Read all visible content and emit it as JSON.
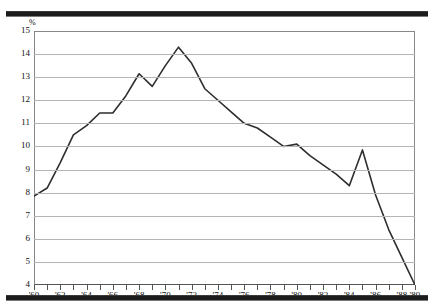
{
  "figure": {
    "unit_label": "%",
    "rules": [
      "top-rule",
      "bottom-rule"
    ]
  },
  "chart_data": {
    "type": "line",
    "title": "",
    "subtitle": "",
    "xlabel": "",
    "ylabel": "%",
    "xlim": [
      1960,
      1989
    ],
    "ylim": [
      4,
      15
    ],
    "grid": true,
    "legend": null,
    "y_ticks": [
      15,
      14,
      13,
      12,
      11,
      10,
      9,
      8,
      7,
      6,
      5,
      4
    ],
    "y_tick_labels": [
      "15",
      "14",
      "13",
      "12",
      "11",
      "10",
      "9",
      "8",
      "7",
      "6",
      "5",
      "4"
    ],
    "x_ticks": [
      1960,
      1961,
      1962,
      1963,
      1964,
      1965,
      1966,
      1967,
      1968,
      1969,
      1970,
      1971,
      1972,
      1973,
      1974,
      1975,
      1976,
      1977,
      1978,
      1979,
      1980,
      1981,
      1982,
      1983,
      1984,
      1985,
      1986,
      1987,
      1988,
      1989
    ],
    "x_tick_labels": [
      {
        "x": 1960,
        "label": "'60"
      },
      {
        "x": 1962,
        "label": "'62"
      },
      {
        "x": 1964,
        "label": "'64"
      },
      {
        "x": 1966,
        "label": "'66"
      },
      {
        "x": 1968,
        "label": "'68"
      },
      {
        "x": 1970,
        "label": "'70"
      },
      {
        "x": 1972,
        "label": "'72"
      },
      {
        "x": 1974,
        "label": "'74"
      },
      {
        "x": 1976,
        "label": "'76"
      },
      {
        "x": 1978,
        "label": "'78"
      },
      {
        "x": 1980,
        "label": "'80"
      },
      {
        "x": 1982,
        "label": "'82"
      },
      {
        "x": 1984,
        "label": "'84"
      },
      {
        "x": 1986,
        "label": "'86"
      },
      {
        "x": 1988,
        "label": "'88"
      },
      {
        "x": 1989,
        "label": "'89"
      }
    ],
    "x": [
      1960,
      1961,
      1962,
      1963,
      1964,
      1965,
      1966,
      1967,
      1968,
      1969,
      1970,
      1971,
      1972,
      1973,
      1974,
      1975,
      1976,
      1977,
      1978,
      1979,
      1980,
      1981,
      1982,
      1983,
      1984,
      1985,
      1986,
      1987,
      1988,
      1989
    ],
    "values": [
      7.85,
      8.2,
      9.3,
      10.5,
      10.9,
      11.45,
      11.45,
      12.2,
      13.15,
      12.6,
      13.5,
      14.3,
      13.6,
      12.5,
      12.0,
      11.5,
      11.0,
      10.8,
      10.4,
      10.0,
      10.1,
      9.6,
      9.2,
      8.8,
      8.3,
      9.85,
      7.9,
      6.4,
      5.2,
      4.0
    ],
    "series_color": "#2e2e2e",
    "grid_color": "#b4b4b4",
    "axis_color": "#777777",
    "rule_color": "#1c1c1c"
  }
}
